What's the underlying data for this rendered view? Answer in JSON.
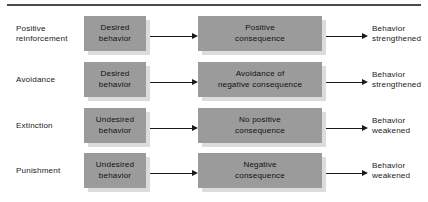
{
  "diagram": {
    "title_rule": "horizontal-rule",
    "colors": {
      "box_fill": "#9b9b9b",
      "box_shadow": "#dcdcdc",
      "rule": "#4a4a4a",
      "text": "#1a1a1a",
      "background": "#ffffff"
    },
    "rows": [
      {
        "category_line1": "Positive",
        "category_line2": "reinforcement",
        "behavior_line1": "Desired",
        "behavior_line2": "behavior",
        "consequence_line1": "Positive",
        "consequence_line2": "consequence",
        "outcome_line1": "Behavior",
        "outcome_line2": "strengthened"
      },
      {
        "category_line1": "Avoidance",
        "category_line2": "",
        "behavior_line1": "Desired",
        "behavior_line2": "behavior",
        "consequence_line1": "Avoidance of",
        "consequence_line2": "negative consequence",
        "outcome_line1": "Behavior",
        "outcome_line2": "strengthened"
      },
      {
        "category_line1": "Extinction",
        "category_line2": "",
        "behavior_line1": "Undesired",
        "behavior_line2": "behavior",
        "consequence_line1": "No positive",
        "consequence_line2": "consequence",
        "outcome_line1": "Behavior",
        "outcome_line2": "weakened"
      },
      {
        "category_line1": "Punishment",
        "category_line2": "",
        "behavior_line1": "Undesired",
        "behavior_line2": "behavior",
        "consequence_line1": "Negative",
        "consequence_line2": "consequence",
        "outcome_line1": "Behavior",
        "outcome_line2": "weakened"
      }
    ]
  }
}
